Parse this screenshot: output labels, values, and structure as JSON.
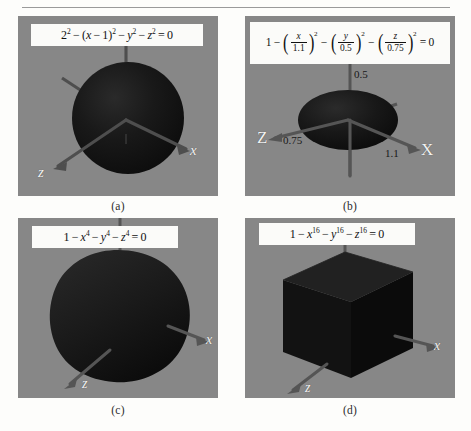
{
  "figure": {
    "background_color": "#fdfdfb",
    "panel_color": "#878787",
    "surface_color": "#151515",
    "axis_color": "#4d4d4d",
    "axis_label_color": "#f2f2f2",
    "tick_label_color": "#171717",
    "formula_box_color": "#fbfbf9"
  },
  "panels": [
    {
      "id": "a",
      "caption": "(a)",
      "formula_plain": "2^2 - (x - 1)^2 - y^2 - z^2 = 0",
      "formula": {
        "terms": [
          "2",
          "2",
          "(x − 1)",
          "2",
          "y",
          "2",
          "z",
          "2",
          "0"
        ]
      },
      "shape": "sphere",
      "axes": [
        {
          "name": "y",
          "label": "y"
        },
        {
          "name": "x",
          "label": "x"
        },
        {
          "name": "z",
          "label": "z"
        }
      ],
      "tick_labels": []
    },
    {
      "id": "b",
      "caption": "(b)",
      "formula_plain": "1 - (x/1.1)^2 - (y/0.5)^2 - (z/0.75)^2 = 0",
      "formula": {
        "lead": "1",
        "fractions": [
          {
            "numerator": "x",
            "denominator": "1.1",
            "exponent": "2"
          },
          {
            "numerator": "y",
            "denominator": "0.5",
            "exponent": "2"
          },
          {
            "numerator": "z",
            "denominator": "0.75",
            "exponent": "2"
          }
        ],
        "result": "0"
      },
      "shape": "ellipsoid",
      "axes": [
        {
          "name": "y",
          "label": "y"
        },
        {
          "name": "x",
          "label": "X"
        },
        {
          "name": "z",
          "label": "Z"
        }
      ],
      "tick_labels": [
        {
          "axis": "y",
          "value": "0.5"
        },
        {
          "axis": "z",
          "value": "0.75"
        },
        {
          "axis": "x",
          "value": "1.1"
        }
      ]
    },
    {
      "id": "c",
      "caption": "(c)",
      "formula_plain": "1 - x^4 - y^4 - z^4 = 0",
      "formula": {
        "lead": "1",
        "vars": [
          "x",
          "y",
          "z"
        ],
        "exponent": "4",
        "result": "0"
      },
      "shape": "rounded-cube",
      "axes": [
        {
          "name": "y",
          "label": "y"
        },
        {
          "name": "x",
          "label": "x"
        },
        {
          "name": "z",
          "label": "z"
        }
      ],
      "tick_labels": []
    },
    {
      "id": "d",
      "caption": "(d)",
      "formula_plain": "1 - x^16 - y^16 - z^16 = 0",
      "formula": {
        "lead": "1",
        "vars": [
          "x",
          "y",
          "z"
        ],
        "exponent": "16",
        "result": "0"
      },
      "shape": "cube",
      "axes": [
        {
          "name": "y",
          "label": "y"
        },
        {
          "name": "x",
          "label": "x"
        },
        {
          "name": "z",
          "label": "z"
        }
      ],
      "tick_labels": []
    }
  ]
}
